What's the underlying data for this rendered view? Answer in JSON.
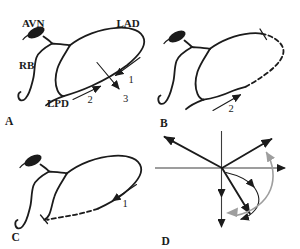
{
  "colors": {
    "ink": "#1b1b1b",
    "gray": "#9e9e9e",
    "background": "#ffffff"
  },
  "panels": {
    "a": {
      "letter": "A",
      "labels": {
        "avn": "AVN",
        "lad": "LAD",
        "rb": "RB",
        "lpd": "LPD"
      },
      "arrow_labels": {
        "n1": "1",
        "n2": "2",
        "n3": "3"
      }
    },
    "b": {
      "letter": "B",
      "arrow_labels": {
        "n2": "2"
      }
    },
    "c": {
      "letter": "C",
      "arrow_labels": {
        "n1": "1"
      }
    },
    "d": {
      "letter": "D"
    }
  }
}
